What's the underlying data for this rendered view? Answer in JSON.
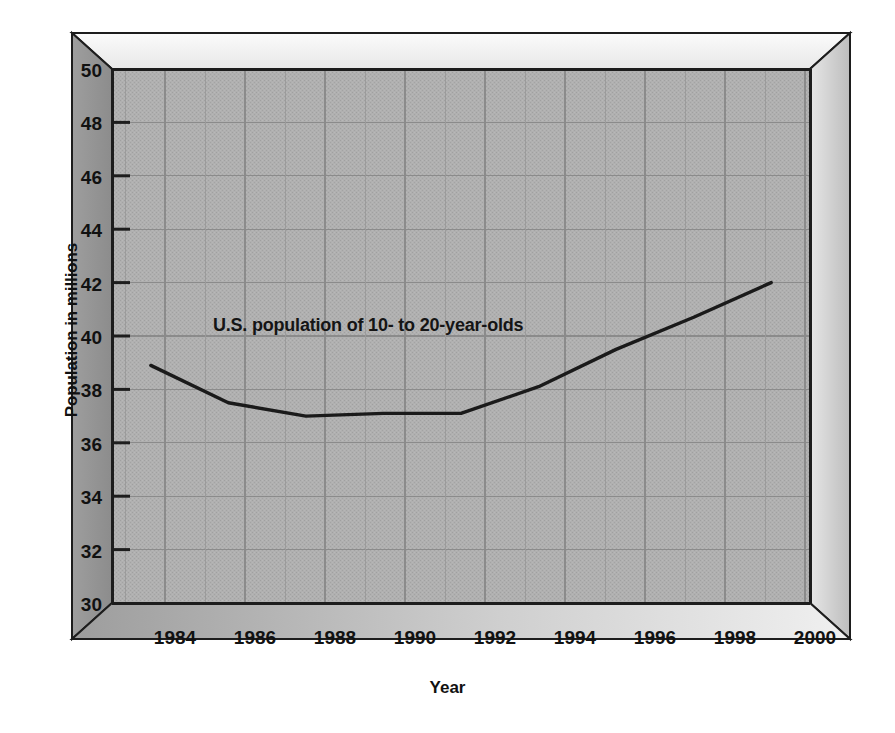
{
  "chart_data": {
    "type": "line",
    "title": "",
    "subtitle": "",
    "xlabel": "Year",
    "ylabel": "Population in millions",
    "xlim": [
      1983,
      2001
    ],
    "ylim": [
      30,
      50
    ],
    "xticks": [
      1984,
      1986,
      1988,
      1990,
      1992,
      1994,
      1996,
      1998,
      2000
    ],
    "yticks": [
      30,
      32,
      34,
      36,
      38,
      40,
      42,
      44,
      46,
      48,
      50
    ],
    "grid": true,
    "legend": "none",
    "x": [
      1984,
      1986,
      1988,
      1990,
      1992,
      1994,
      1996,
      1998,
      2000
    ],
    "series": [
      {
        "name": "U.S. population of 10- to 20-year-olds",
        "values": [
          38.9,
          37.5,
          37.0,
          37.1,
          37.1,
          38.1,
          39.5,
          40.7,
          42.0
        ],
        "color": "#1a1a1a"
      }
    ],
    "annotations": [
      {
        "text": "U.S. population of 10- to 20-year-olds",
        "x": 1989.6,
        "y": 40.4
      }
    ]
  },
  "axes": {
    "ylabel": "Population in millions",
    "xlabel": "Year",
    "ytick_labels": [
      "50",
      "48",
      "46",
      "44",
      "42",
      "40",
      "38",
      "36",
      "34",
      "32",
      "30"
    ],
    "xtick_labels": [
      "1984",
      "1986",
      "1988",
      "1990",
      "1992",
      "1994",
      "1996",
      "1998",
      "2000"
    ]
  },
  "annotation": {
    "series_label": "U.S. population of 10- to 20-year-olds"
  },
  "colors": {
    "plot_background": "#adadad",
    "frame_light": "#f2f2f2",
    "frame_dark": "#8a8a8a",
    "frame_side": "#9a9a9a",
    "line": "#1a1a1a",
    "grid": "#8f8f8f",
    "text": "#111111"
  }
}
